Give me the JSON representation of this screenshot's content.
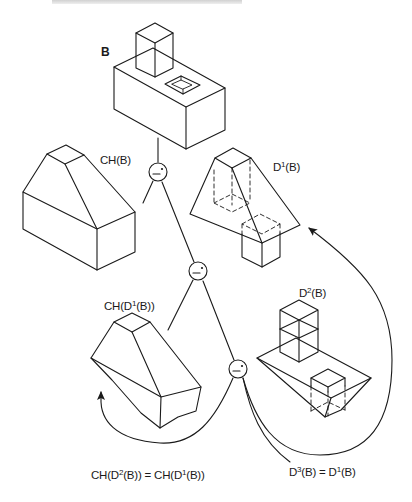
{
  "figure": {
    "header_text_visible": false,
    "stroke_color": "#1a1a1a",
    "background": "#ffffff"
  },
  "labels": {
    "b": "B",
    "ch_b": {
      "pre": "CH(B)"
    },
    "d1_b": {
      "pre": "D",
      "sup": "1",
      "post": "(B)"
    },
    "ch_d1_b": {
      "pre": "CH(D",
      "sup": "1",
      "post": "(B))"
    },
    "d2_b": {
      "pre": "D",
      "sup": "2",
      "post": "(B)"
    },
    "equation_left": {
      "p1": "CH(D",
      "s1": "2",
      "p2": "(B)) = CH(D",
      "s2": "1",
      "p3": "(B))"
    },
    "equation_right": {
      "p1": "D",
      "s1": "3",
      "p2": "(B) = D",
      "s2": "1",
      "p3": "(B)"
    }
  },
  "operator_nodes": [
    {
      "id": "diff-1",
      "symbol": "−*",
      "meaning": "regularized difference"
    },
    {
      "id": "diff-2",
      "symbol": "−*",
      "meaning": "regularized difference"
    },
    {
      "id": "diff-3",
      "symbol": "−*",
      "meaning": "regularized difference"
    }
  ],
  "solids": [
    {
      "id": "B",
      "description": "block with raised square post and square pocket"
    },
    {
      "id": "CH(B)",
      "description": "convex hull of B"
    },
    {
      "id": "D1(B)",
      "description": "convex deficiency of B (hull minus B)"
    },
    {
      "id": "CH(D1(B))",
      "description": "convex hull of D1(B)"
    },
    {
      "id": "D2(B)",
      "description": "second deficiency"
    }
  ]
}
